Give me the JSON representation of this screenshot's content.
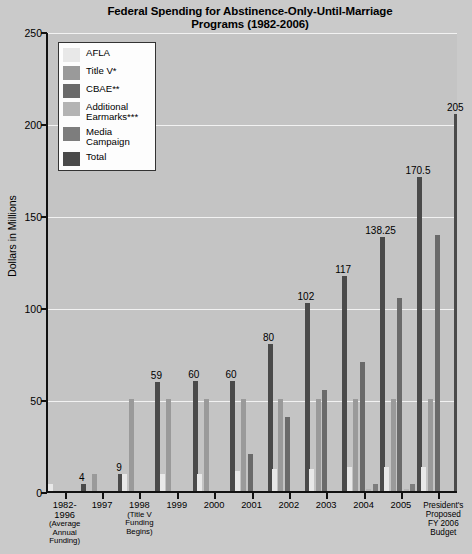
{
  "chart_data": {
    "type": "bar",
    "title": "Federal Spending for Abstinence-Only-Until-Marriage Programs (1982-2006)",
    "title_line1": "Federal Spending for Abstinence-Only-Until-Marriage",
    "title_line2": "Programs (1982-2006)",
    "xlabel": "",
    "ylabel": "Dollars in Millions",
    "ylim": [
      0,
      250
    ],
    "yticks": [
      0,
      50,
      100,
      150,
      200,
      250
    ],
    "grid": true,
    "legend_position": "top-left",
    "categories": [
      "1982-1996",
      "1997",
      "1998",
      "1999",
      "2000",
      "2001",
      "2002",
      "2003",
      "2004",
      "2005",
      "President's Proposed FY 2006 Budget"
    ],
    "category_sublabels": [
      "(Average Annual Funding)",
      "",
      "(Title V Funding Begins)",
      "",
      "",
      "",
      "",
      "",
      "",
      "",
      ""
    ],
    "series": [
      {
        "name": "AFLA",
        "color": "#e8e8e8",
        "values": [
          4,
          0,
          9,
          9,
          9,
          11,
          12,
          12,
          13,
          13,
          13
        ]
      },
      {
        "name": "Title V*",
        "color": "#9a9a9a",
        "values": [
          0,
          9,
          50,
          50,
          50,
          50,
          50,
          50,
          50,
          50,
          50
        ]
      },
      {
        "name": "CBAE**",
        "color": "#6a6a6a",
        "values": [
          0,
          0,
          0,
          0,
          0,
          20,
          40,
          55,
          70,
          105,
          139
        ]
      },
      {
        "name": "Additional Earmarks***",
        "color": "#b4b4b4",
        "values": [
          0,
          0,
          0,
          0,
          0,
          0,
          0,
          0,
          1,
          1,
          0
        ]
      },
      {
        "name": "Media Campaign",
        "color": "#7d7d7d",
        "values": [
          0,
          0,
          0,
          0,
          0,
          0,
          0,
          0,
          4,
          4,
          0
        ]
      },
      {
        "name": "Total",
        "color": "#4a4a4a",
        "values": [
          4,
          9,
          59,
          60,
          60,
          80,
          102,
          117,
          138.25,
          170.5,
          205
        ]
      }
    ],
    "total_labels": [
      "4",
      "9",
      "59",
      "60",
      "60",
      "80",
      "102",
      "117",
      "138.25",
      "170.5",
      "205"
    ]
  },
  "legend": {
    "items": [
      {
        "label": "AFLA"
      },
      {
        "label": "Title V*"
      },
      {
        "label": "CBAE**"
      },
      {
        "label": "Additional Earmarks***"
      },
      {
        "label": "Media Campaign"
      },
      {
        "label": "Total"
      }
    ]
  }
}
